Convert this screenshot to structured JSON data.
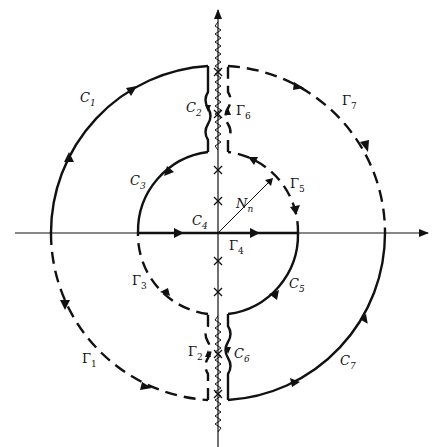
{
  "figure": {
    "colors": {
      "stroke": "#111111",
      "background": "#ffffff"
    },
    "axes": {
      "horizontal": {
        "arrow": "right"
      },
      "vertical": {
        "arrow": "up"
      }
    },
    "contours": {
      "solid": [
        {
          "name": "C",
          "sub": "1",
          "desc": "outer arc, upper-left quadrant"
        },
        {
          "name": "C",
          "sub": "2",
          "desc": "indentation along upper branch cut, left side"
        },
        {
          "name": "C",
          "sub": "3",
          "desc": "inner arc, upper-left"
        },
        {
          "name": "C",
          "sub": "4",
          "desc": "segment along real axis toward origin"
        },
        {
          "name": "C",
          "sub": "5",
          "desc": "inner arc, lower-right"
        },
        {
          "name": "C",
          "sub": "6",
          "desc": "indentation along lower branch cut, right side"
        },
        {
          "name": "C",
          "sub": "7",
          "desc": "outer arc, lower-right quadrant"
        }
      ],
      "dashed": [
        {
          "name": "Γ",
          "sub": "1",
          "desc": "outer arc, lower-left quadrant"
        },
        {
          "name": "Γ",
          "sub": "2",
          "desc": "indentation along lower branch cut, left side"
        },
        {
          "name": "Γ",
          "sub": "3",
          "desc": "inner arc, lower-left"
        },
        {
          "name": "Γ",
          "sub": "4",
          "desc": "segment along real axis away from origin"
        },
        {
          "name": "Γ",
          "sub": "5",
          "desc": "inner arc, upper-right"
        },
        {
          "name": "Γ",
          "sub": "6",
          "desc": "indentation along upper branch cut, right side"
        },
        {
          "name": "Γ",
          "sub": "7",
          "desc": "outer arc, upper-right quadrant"
        }
      ]
    },
    "radius_label": {
      "name": "N",
      "sub": "n"
    },
    "poles_marker": "×"
  }
}
